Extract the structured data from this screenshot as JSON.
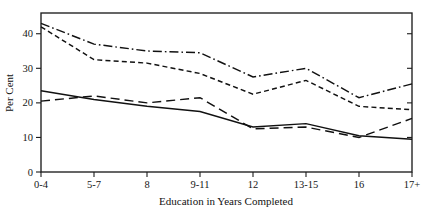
{
  "figure": {
    "background": "#ffffff",
    "ink_color": "#111111"
  },
  "axes": {
    "ylabel": "Per Cent",
    "xlabel": "Education in Years Completed",
    "yticks": [
      "0",
      "10",
      "20",
      "30",
      "40"
    ],
    "xticks": [
      "0-4",
      "5-7",
      "8",
      "9-11",
      "12",
      "13-15",
      "16",
      "17+"
    ]
  },
  "chart_data": {
    "type": "line",
    "title": "",
    "xlabel": "Education in Years Completed",
    "ylabel": "Per Cent",
    "categories": [
      "0-4",
      "5-7",
      "8",
      "9-11",
      "12",
      "13-15",
      "16",
      "17+"
    ],
    "ylim": [
      0,
      46
    ],
    "yticks": [
      0,
      10,
      20,
      30,
      40
    ],
    "grid": false,
    "legend": "none",
    "series": [
      {
        "name": "series-1",
        "style": "dash-dot",
        "dasharray": "9 3 1.6 3",
        "values": [
          43,
          37,
          35,
          34.5,
          27.5,
          30,
          21.5,
          25.5
        ]
      },
      {
        "name": "series-2",
        "style": "short-dash",
        "dasharray": "5 3.2",
        "values": [
          42,
          32.5,
          31.5,
          28.5,
          22.5,
          26.5,
          19,
          18
        ]
      },
      {
        "name": "series-3",
        "style": "long-dash",
        "dasharray": "9 5",
        "values": [
          20.5,
          22,
          20,
          21.5,
          12.5,
          13,
          10,
          15.5
        ]
      },
      {
        "name": "series-4",
        "style": "solid",
        "dasharray": "none",
        "values": [
          23.5,
          21,
          19,
          17.5,
          13,
          14,
          10.5,
          9.5
        ]
      }
    ]
  }
}
